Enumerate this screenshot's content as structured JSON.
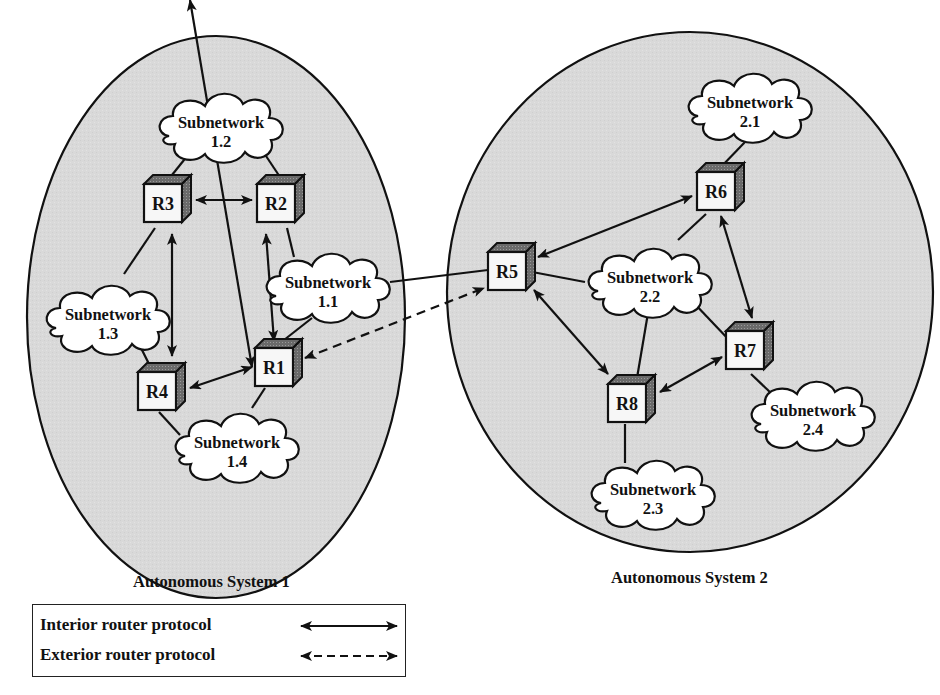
{
  "diagram": {
    "colors": {
      "system_fill": "#d9d9d9",
      "stroke": "#111111",
      "cloud_fill": "#ffffff",
      "router_front": "#f7f7f7",
      "router_top": "#555555",
      "router_side": "#777777"
    },
    "autonomous_systems": [
      {
        "id": "as1",
        "label": "Autonomous System 1"
      },
      {
        "id": "as2",
        "label": "Autonomous System 2"
      }
    ],
    "routers": [
      {
        "id": "R1",
        "label": "R1",
        "system": "as1"
      },
      {
        "id": "R2",
        "label": "R2",
        "system": "as1"
      },
      {
        "id": "R3",
        "label": "R3",
        "system": "as1"
      },
      {
        "id": "R4",
        "label": "R4",
        "system": "as1"
      },
      {
        "id": "R5",
        "label": "R5",
        "system": "as2"
      },
      {
        "id": "R6",
        "label": "R6",
        "system": "as2"
      },
      {
        "id": "R7",
        "label": "R7",
        "system": "as2"
      },
      {
        "id": "R8",
        "label": "R8",
        "system": "as2"
      }
    ],
    "subnetworks": [
      {
        "id": "1.1",
        "line1": "Subnetwork",
        "line2": "1.1"
      },
      {
        "id": "1.2",
        "line1": "Subnetwork",
        "line2": "1.2"
      },
      {
        "id": "1.3",
        "line1": "Subnetwork",
        "line2": "1.3"
      },
      {
        "id": "1.4",
        "line1": "Subnetwork",
        "line2": "1.4"
      },
      {
        "id": "2.1",
        "line1": "Subnetwork",
        "line2": "2.1"
      },
      {
        "id": "2.2",
        "line1": "Subnetwork",
        "line2": "2.2"
      },
      {
        "id": "2.3",
        "line1": "Subnetwork",
        "line2": "2.3"
      },
      {
        "id": "2.4",
        "line1": "Subnetwork",
        "line2": "2.4"
      }
    ],
    "interior_links": [
      [
        "R3",
        "R2"
      ],
      [
        "R3",
        "R4"
      ],
      [
        "R2",
        "R1"
      ],
      [
        "R4",
        "R1"
      ],
      [
        "R5",
        "R6"
      ],
      [
        "R6",
        "R7"
      ],
      [
        "R5",
        "R8"
      ],
      [
        "R8",
        "R7"
      ]
    ],
    "exterior_links": [
      [
        "R1",
        "R5"
      ]
    ],
    "attachments": [
      [
        "1.2",
        "R3"
      ],
      [
        "1.2",
        "R2"
      ],
      [
        "1.1",
        "R2"
      ],
      [
        "1.1",
        "R1"
      ],
      [
        "1.1",
        "R5"
      ],
      [
        "1.3",
        "R3"
      ],
      [
        "1.3",
        "R4"
      ],
      [
        "1.4",
        "R4"
      ],
      [
        "1.4",
        "R1"
      ],
      [
        "2.1",
        "R6"
      ],
      [
        "2.2",
        "R5"
      ],
      [
        "2.2",
        "R6"
      ],
      [
        "2.2",
        "R7"
      ],
      [
        "2.2",
        "R8"
      ],
      [
        "2.3",
        "R8"
      ],
      [
        "2.4",
        "R7"
      ]
    ]
  },
  "legend": {
    "items": [
      {
        "label": "Interior router protocol",
        "line_style": "solid"
      },
      {
        "label": "Exterior router protocol",
        "line_style": "dashed"
      }
    ]
  }
}
